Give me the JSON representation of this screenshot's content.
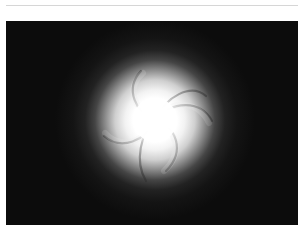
{
  "figure": {
    "colors": {
      "background": "#0c0c0c",
      "glow_core": "#ffffff",
      "page": "#ffffff",
      "rule": "#d6d6d6"
    },
    "spiral_arms": 6
  }
}
